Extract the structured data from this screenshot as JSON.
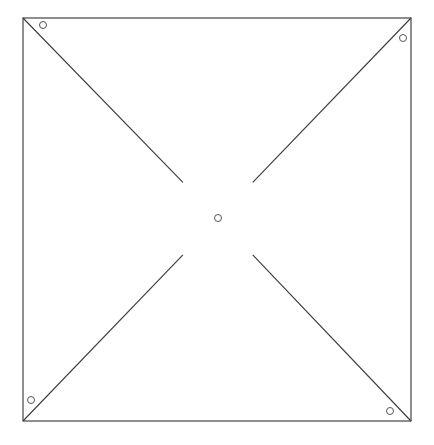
{
  "diagram": {
    "title": "",
    "type": "pinwheel-template",
    "colors": {
      "line": "#3a3a3a",
      "border": "#444444",
      "hole": "#555555",
      "background": "#ffffff"
    },
    "elements": {
      "border": {
        "shape": "square",
        "label": ""
      },
      "cut_lines": [
        {
          "id": "top-left",
          "from_corner": "top-left",
          "toward": "center"
        },
        {
          "id": "top-right",
          "from_corner": "top-right",
          "toward": "center"
        },
        {
          "id": "bottom-left",
          "from_corner": "bottom-left",
          "toward": "center"
        },
        {
          "id": "bottom-right",
          "from_corner": "bottom-right",
          "toward": "center"
        }
      ],
      "holes": [
        {
          "id": "center",
          "position": "center"
        },
        {
          "id": "top-left",
          "position": "top-left corner, right of diagonal"
        },
        {
          "id": "top-right",
          "position": "top-right corner, below diagonal"
        },
        {
          "id": "bottom-left",
          "position": "bottom-left corner, above diagonal"
        },
        {
          "id": "bottom-right",
          "position": "bottom-right corner, left of diagonal"
        }
      ],
      "cut_fraction_uncut_near_center": 0.18
    }
  }
}
